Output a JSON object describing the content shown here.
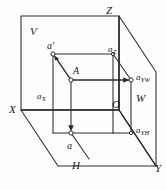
{
  "figure": {
    "kind": "descriptive-geometry-projection",
    "background_color": "#fefefe",
    "line_color": "#2b2b2b",
    "text_color": "#1a1a1a",
    "width": 166,
    "height": 190
  },
  "planes": [
    {
      "id": "V",
      "label": "V",
      "name": "vertical-frontal-projection-plane"
    },
    {
      "id": "H",
      "label": "H",
      "name": "horizontal-projection-plane"
    },
    {
      "id": "W",
      "label": "W",
      "name": "profile-side-projection-plane"
    }
  ],
  "axes": [
    {
      "id": "X",
      "label": "X"
    },
    {
      "id": "Y",
      "label": "Y"
    },
    {
      "id": "Z",
      "label": "Z"
    },
    {
      "id": "O",
      "label": "O"
    }
  ],
  "points": [
    {
      "id": "A",
      "label": "A",
      "type": "space-point"
    },
    {
      "id": "ap",
      "label": "a′",
      "type": "frontal-projection"
    },
    {
      "id": "a",
      "label": "a",
      "type": "horizontal-projection"
    },
    {
      "id": "aYW",
      "label": "a",
      "sub": "YW",
      "type": "profile-projection"
    }
  ],
  "foot_labels": [
    {
      "id": "aX",
      "label": "a",
      "sub": "X"
    },
    {
      "id": "aZ",
      "label": "a",
      "sub": "Z"
    },
    {
      "id": "aYW",
      "label": "a",
      "sub": "YW"
    },
    {
      "id": "aYH",
      "label": "a",
      "sub": "YH"
    }
  ],
  "projection_arrows": [
    {
      "from": "A",
      "to": "ap",
      "direction": "up-left"
    },
    {
      "from": "A",
      "to": "aYW",
      "direction": "right"
    },
    {
      "from": "A",
      "to": "a",
      "direction": "down"
    }
  ]
}
